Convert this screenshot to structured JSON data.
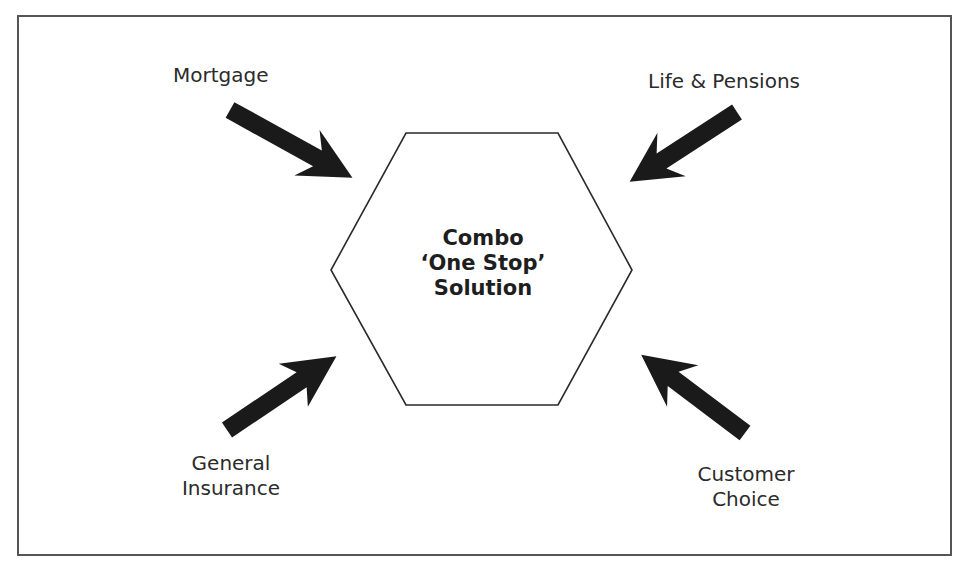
{
  "diagram": {
    "center": {
      "lines": [
        "Combo",
        "‘One Stop’",
        "Solution"
      ],
      "shape": "hexagon"
    },
    "inputs": [
      {
        "label": "Mortgage",
        "position": "top-left",
        "arrow_direction": "down-right"
      },
      {
        "label": "Life & Pensions",
        "position": "top-right",
        "arrow_direction": "down-left"
      },
      {
        "label_lines": [
          "General",
          "Insurance"
        ],
        "position": "bottom-left",
        "arrow_direction": "up-right"
      },
      {
        "label_lines": [
          "Customer",
          "Choice"
        ],
        "position": "bottom-right",
        "arrow_direction": "up-left"
      }
    ],
    "colors": {
      "frame": "#555555",
      "hexagon_stroke": "#2a2a2a",
      "arrow_fill": "#1a1a1a",
      "text": "#2b2b2b"
    }
  }
}
